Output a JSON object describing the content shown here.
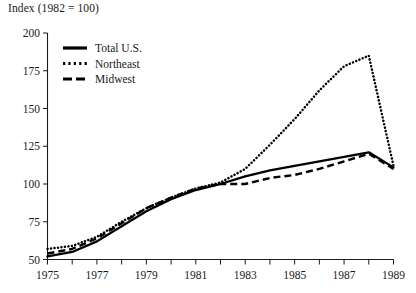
{
  "chart_data": {
    "type": "line",
    "title": "Index (1982 = 100)",
    "ylabel": "Index (1982 = 100)",
    "xlabel": "",
    "xlim": [
      1975,
      1989
    ],
    "ylim": [
      50,
      200
    ],
    "grid": false,
    "legend_position": "top-left inside plot",
    "x": [
      1975,
      1976,
      1977,
      1978,
      1979,
      1980,
      1981,
      1982,
      1983,
      1984,
      1985,
      1986,
      1987,
      1988,
      1989
    ],
    "xticks": [
      1975,
      1976,
      1977,
      1978,
      1979,
      1980,
      1981,
      1982,
      1983,
      1984,
      1985,
      1986,
      1987,
      1988,
      1989
    ],
    "xtick_labels": [
      "1975",
      "",
      "1977",
      "",
      "1979",
      "",
      "1981",
      "",
      "1983",
      "",
      "1985",
      "",
      "1987",
      "",
      "1989"
    ],
    "yticks": [
      50,
      75,
      100,
      125,
      150,
      175,
      200
    ],
    "ytick_labels": [
      "50",
      "75",
      "100",
      "125",
      "150",
      "175",
      "200"
    ],
    "series": [
      {
        "name": "Total U.S.",
        "style": "solid",
        "color": "#000000",
        "values": [
          52,
          55,
          62,
          72,
          82,
          90,
          96,
          100,
          105,
          109,
          112,
          115,
          118,
          121,
          111
        ]
      },
      {
        "name": "Northeast",
        "style": "dotted",
        "color": "#000000",
        "values": [
          57,
          59,
          65,
          75,
          84,
          91,
          97,
          101,
          110,
          126,
          143,
          162,
          178,
          185,
          112
        ]
      },
      {
        "name": "Midwest",
        "style": "dashed",
        "color": "#000000",
        "values": [
          54,
          57,
          64,
          74,
          84,
          91,
          97,
          100,
          100,
          104,
          106,
          110,
          115,
          120,
          110
        ]
      }
    ]
  },
  "legend": {
    "items": [
      {
        "label": "Total U.S.",
        "style": "solid"
      },
      {
        "label": "Northeast",
        "style": "dotted"
      },
      {
        "label": "Midwest",
        "style": "dashed"
      }
    ]
  }
}
